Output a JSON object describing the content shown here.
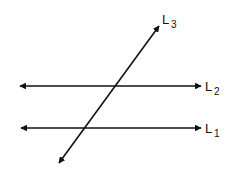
{
  "diagram": {
    "type": "parallel lines cut by a transversal",
    "lines": [
      {
        "id": "L1",
        "label": "L",
        "subscript": "1",
        "kind": "horizontal",
        "y": 128,
        "x1": 18,
        "x2": 204
      },
      {
        "id": "L2",
        "label": "L",
        "subscript": "2",
        "kind": "horizontal",
        "y": 86,
        "x1": 17,
        "x2": 204
      },
      {
        "id": "L3",
        "label": "L",
        "subscript": "3",
        "kind": "transversal",
        "x1": 57,
        "y1": 166,
        "x2": 161,
        "y2": 23
      }
    ],
    "stroke_color": "#111111",
    "background": "#ffffff"
  }
}
